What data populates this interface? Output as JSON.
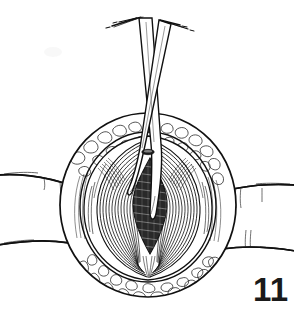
{
  "figure": {
    "number_label": "11",
    "caption": "",
    "type": "surgical-line-art-illustration",
    "background_color": "#ffffff",
    "ink_color": "#111111",
    "width": 294,
    "height": 320
  },
  "scene": {
    "title": "",
    "description": "Line drawing of an open surgical field: a circular incision through skin and subcutaneous fat exposing a vertically split muscle layer, with a dark lens-shaped deep incision at the center and a pair of surgical scissors inserted from above.",
    "elements": [
      {
        "name": "surgical-drape-left",
        "label": "Surgical drape / towel, left",
        "interactable": false
      },
      {
        "name": "surgical-drape-right",
        "label": "Surgical drape / towel, right",
        "interactable": false
      },
      {
        "name": "wound-opening",
        "label": "Circular wound opening",
        "interactable": false
      },
      {
        "name": "subcutaneous-fat-margin",
        "label": "Subcutaneous fat margin",
        "interactable": false
      },
      {
        "name": "muscle-layer-left",
        "label": "Muscle belly, left half",
        "interactable": false
      },
      {
        "name": "muscle-layer-right",
        "label": "Muscle belly, right half",
        "interactable": false
      },
      {
        "name": "deep-incision",
        "label": "Deep lens-shaped incision",
        "interactable": false
      },
      {
        "name": "surgical-scissors",
        "label": "Surgical scissors",
        "interactable": false
      },
      {
        "name": "scissors-pivot-screw",
        "label": "Scissors pivot screw",
        "interactable": false
      }
    ]
  },
  "drawing": {
    "geometry": {
      "wound_circle": {
        "cx": 148,
        "cy": 205,
        "rx": 88,
        "ry": 92
      },
      "muscle_oval": {
        "cx": 148,
        "cy": 207,
        "rx": 64,
        "ry": 72
      },
      "incision": {
        "cx": 150,
        "cy": 205,
        "half_width": 17,
        "top_y": 160,
        "bottom_y": 252
      },
      "pivot_screw": {
        "cx": 148,
        "cy": 152,
        "rx": 6,
        "ry": 2.6
      },
      "scissors_apex": {
        "x": 150,
        "y": 16
      },
      "blade_tip": {
        "x": 154,
        "y": 215
      }
    },
    "counts": {
      "muscle_fibers_left": 17,
      "muscle_fibers_right": 17,
      "fat_scallops_upper": 26,
      "fat_scallops_lower": 22,
      "hatch_lines_incision": 22,
      "drape_fold_lines_left": 9,
      "drape_fold_lines_right": 9,
      "handle_shanks": 4
    }
  }
}
